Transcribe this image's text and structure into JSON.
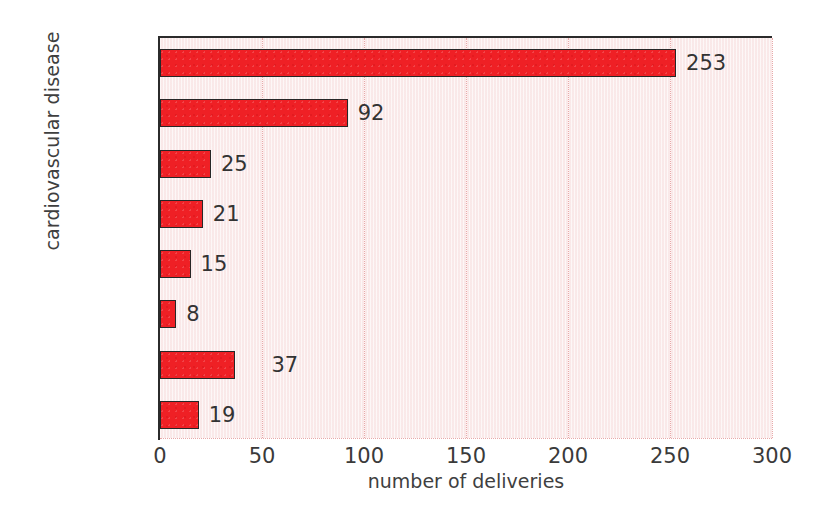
{
  "chart_data": {
    "type": "bar",
    "orientation": "horizontal",
    "title": "",
    "xlabel": "number of deliveries",
    "ylabel": "cardiovascular disease",
    "categories": [
      "CHD",
      "VHD",
      "CM",
      "AoRo D",
      "KD",
      "PH",
      "others",
      "unknown"
    ],
    "values": [
      253,
      92,
      25,
      21,
      15,
      8,
      37,
      19
    ],
    "value_labels": [
      "253",
      "92",
      "25",
      "21",
      "15",
      "8",
      "37",
      "19"
    ],
    "xlim": [
      0,
      300
    ],
    "xticks": [
      0,
      50,
      100,
      150,
      200,
      250,
      300
    ],
    "xtick_labels": [
      "0",
      "50",
      "100",
      "150",
      "200",
      "250",
      "300"
    ],
    "grid": "vertical-dotted",
    "legend": "none",
    "colors": {
      "bar_fill": "#ef2025",
      "bar_edge": "#272727",
      "plot_background": "#fbeeee",
      "gridline": "#e8a9a9",
      "axis": "#2b2b2b",
      "text": "#3a3a3a",
      "page_background": "#ffffff"
    }
  }
}
